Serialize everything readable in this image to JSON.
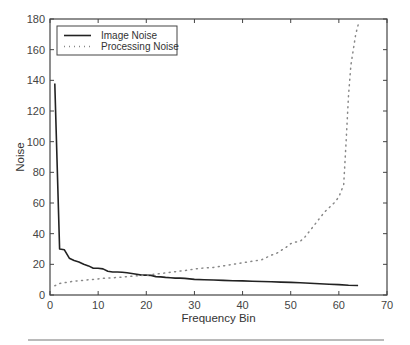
{
  "chart_data": {
    "type": "line",
    "title": "",
    "xlabel": "Frequency Bin",
    "ylabel": "Noise",
    "xlim": [
      0,
      70
    ],
    "ylim": [
      0,
      180
    ],
    "xticks": [
      0,
      10,
      20,
      30,
      40,
      50,
      60,
      70
    ],
    "yticks": [
      0,
      20,
      40,
      60,
      80,
      100,
      120,
      140,
      160,
      180
    ],
    "grid": false,
    "legend_position": "upper left",
    "series": [
      {
        "name": "Image Noise",
        "style": "solid",
        "color": "#222222",
        "x": [
          1,
          2,
          3,
          4,
          5,
          6,
          7,
          8,
          9,
          10,
          11,
          12,
          13,
          14,
          15,
          16,
          17,
          18,
          19,
          20,
          21,
          22,
          23,
          24,
          25,
          26,
          27,
          28,
          29,
          30,
          32,
          34,
          36,
          38,
          40,
          42,
          44,
          46,
          48,
          50,
          52,
          54,
          56,
          58,
          60,
          62,
          64
        ],
        "values": [
          138,
          30,
          29.5,
          24,
          22.5,
          21.5,
          20,
          19,
          17.5,
          17.5,
          17,
          15.5,
          15,
          15,
          14.8,
          14.5,
          14,
          13.5,
          13,
          13,
          12.8,
          12,
          11.8,
          11.5,
          11.3,
          11,
          11,
          10.8,
          10.5,
          10.2,
          10,
          9.8,
          9.5,
          9.3,
          9.2,
          9,
          8.8,
          8.6,
          8.4,
          8.2,
          8,
          7.6,
          7.3,
          7,
          6.8,
          6.4,
          6.2
        ]
      },
      {
        "name": "Processing Noise",
        "style": "dotted",
        "color": "#888888",
        "x": [
          1,
          2,
          3,
          4,
          5,
          6,
          7,
          8,
          9,
          10,
          11,
          12,
          13,
          14,
          15,
          16,
          17,
          18,
          19,
          20,
          21,
          22,
          23,
          24,
          25,
          26,
          27,
          28,
          29,
          30,
          31,
          32,
          33,
          34,
          35,
          36,
          37,
          38,
          39,
          40,
          41,
          42,
          43,
          44,
          45,
          46,
          47,
          48,
          49,
          50,
          51,
          52,
          53,
          54,
          55,
          56,
          57,
          58,
          59,
          60,
          61,
          61.5,
          62,
          62.5,
          63,
          63.5,
          64
        ],
        "values": [
          6,
          7.5,
          8,
          8.5,
          9,
          9.3,
          9.6,
          10,
          10.2,
          10.5,
          10.8,
          11,
          11.2,
          11.5,
          11.7,
          12,
          12.2,
          12.5,
          12.8,
          13,
          13.3,
          13.6,
          14,
          14.4,
          14.8,
          15.2,
          15.6,
          16,
          16.4,
          17,
          17.3,
          17.6,
          17.8,
          18,
          18.5,
          19,
          19.5,
          20,
          20.5,
          21,
          21.5,
          22,
          22.5,
          23,
          24.5,
          26,
          27,
          29,
          31,
          33.5,
          34.5,
          35,
          38,
          42,
          46,
          50,
          54,
          57,
          60,
          64,
          72,
          100,
          130,
          150,
          160,
          170,
          176
        ]
      }
    ]
  },
  "legend": {
    "items": [
      {
        "label": "Image Noise",
        "style": "solid"
      },
      {
        "label": "Processing Noise",
        "style": "dotted"
      }
    ]
  },
  "axes": {
    "xlabel": "Frequency Bin",
    "ylabel": "Noise"
  }
}
